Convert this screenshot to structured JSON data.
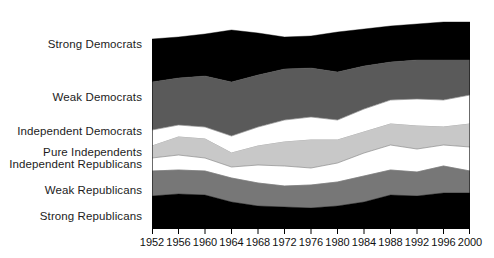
{
  "chart_data": {
    "type": "area",
    "title": "",
    "subtitle": "",
    "xlabel": "",
    "ylabel": "",
    "stacked": true,
    "stack_order": "top-to-bottom",
    "grid": false,
    "legend_position": "left-inline-labels",
    "xlim": [
      1952,
      2000
    ],
    "ylim": [
      0,
      100
    ],
    "x": [
      1952,
      1956,
      1960,
      1964,
      1968,
      1972,
      1976,
      1980,
      1984,
      1988,
      1992,
      1996,
      2000
    ],
    "categories": [
      "1952",
      "1956",
      "1960",
      "1964",
      "1968",
      "1972",
      "1976",
      "1980",
      "1984",
      "1988",
      "1992",
      "1996",
      "2000"
    ],
    "series": [
      {
        "name": "Strong Democrats",
        "color": "#000000",
        "values": [
          22,
          21,
          21,
          27,
          20,
          15,
          15,
          18,
          17,
          18,
          18,
          19,
          19
        ]
      },
      {
        "name": "Weak Democrats",
        "color": "#5a5a5a",
        "values": [
          25,
          23,
          25,
          25,
          25,
          26,
          25,
          23,
          20,
          18,
          18,
          19,
          15
        ]
      },
      {
        "name": "Independent Democrats",
        "color": "#ffffff",
        "values": [
          10,
          6,
          6,
          9,
          10,
          11,
          12,
          11,
          11,
          12,
          14,
          14,
          15
        ]
      },
      {
        "name": "Pure Independents",
        "color": "#c8c8c8",
        "values": [
          6,
          9,
          10,
          8,
          11,
          13,
          15,
          13,
          11,
          11,
          12,
          9,
          12
        ]
      },
      {
        "name": "Independent Republicans",
        "color": "#ffffff",
        "values": [
          7,
          8,
          7,
          6,
          9,
          11,
          10,
          10,
          12,
          13,
          12,
          11,
          13
        ]
      },
      {
        "name": "Weak Republicans",
        "color": "#777777",
        "values": [
          14,
          14,
          14,
          14,
          15,
          13,
          14,
          14,
          15,
          14,
          14,
          15,
          12
        ]
      },
      {
        "name": "Strong Republicans",
        "color": "#000000",
        "values": [
          14,
          15,
          16,
          11,
          10,
          10,
          9,
          9,
          12,
          14,
          11,
          12,
          12
        ]
      }
    ],
    "band_labels": [
      {
        "text": "Strong Democrats",
        "y": 44
      },
      {
        "text": "Weak Democrats",
        "y": 97
      },
      {
        "text": "Independent Democrats",
        "y": 131
      },
      {
        "text": "Pure Independents",
        "y": 152
      },
      {
        "text": "Independent Republicans",
        "y": 164
      },
      {
        "text": "Weak Republicans",
        "y": 190
      },
      {
        "text": "Strong Republicans",
        "y": 216
      }
    ],
    "boundaries_px": {
      "note": "Cumulative band boundary y-positions in plot pixel space (0=plot top, 219=plot bottom), per x tick.",
      "b0_top": [
        29,
        27,
        24,
        20,
        23,
        27,
        26,
        22,
        19,
        16,
        14,
        12,
        12
      ],
      "b1_sd_wd": [
        72,
        68,
        66,
        72,
        65,
        59,
        58,
        62,
        56,
        52,
        50,
        50,
        50
      ],
      "b2_wd_id": [
        120,
        115,
        117,
        126,
        117,
        110,
        107,
        110,
        99,
        90,
        89,
        90,
        85
      ],
      "b3_id_pi": [
        136,
        127,
        129,
        143,
        136,
        132,
        130,
        130,
        122,
        114,
        116,
        117,
        114
      ],
      "b4_pi_ir": [
        148,
        145,
        148,
        157,
        155,
        156,
        158,
        153,
        143,
        135,
        139,
        135,
        137
      ],
      "b5_ir_wr": [
        161,
        160,
        161,
        168,
        173,
        176,
        175,
        172,
        166,
        160,
        162,
        156,
        161
      ],
      "b6_wr_sr": [
        186,
        184,
        185,
        192,
        196,
        197,
        198,
        196,
        192,
        185,
        186,
        183,
        183
      ],
      "b7_bottom": [
        219,
        219,
        219,
        219,
        219,
        219,
        219,
        219,
        219,
        219,
        219,
        219,
        219
      ]
    }
  },
  "axis": {
    "tick_labels": [
      "1952",
      "1956",
      "1960",
      "1964",
      "1968",
      "1972",
      "1976",
      "1980",
      "1984",
      "1988",
      "1992",
      "1996",
      "2000"
    ]
  },
  "colors": {
    "strong_democrats": "#000000",
    "weak_democrats": "#5a5a5a",
    "independent_democrats": "#ffffff",
    "pure_independents": "#c8c8c8",
    "independent_republicans": "#ffffff",
    "weak_republicans": "#777777",
    "strong_republicans": "#000000",
    "text": "#1c1c1c",
    "background": "#ffffff"
  }
}
